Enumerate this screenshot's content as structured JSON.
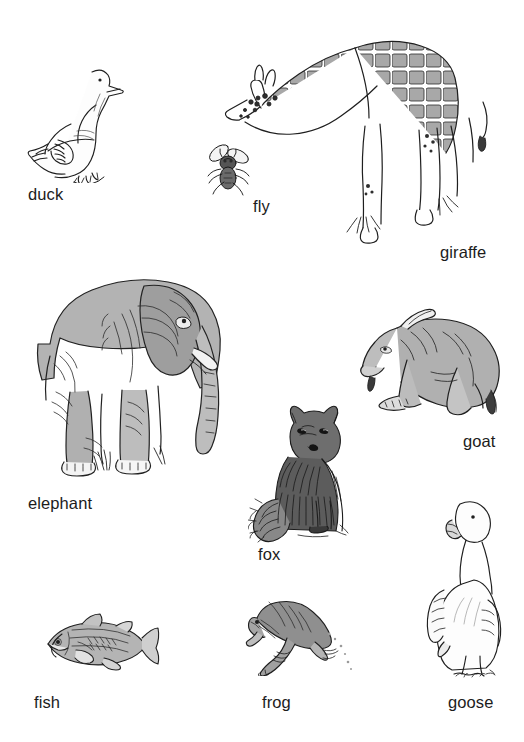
{
  "page": {
    "kind": "illustrated-vocabulary-sheet",
    "background_color": "#ffffff",
    "ink_color": "#1c1c1c",
    "wash_color": "#9d9d9d",
    "width": 524,
    "height": 742
  },
  "items": [
    {
      "id": "duck",
      "label": "duck",
      "icon_name": "duck-illustration",
      "description": "pen-and-ink drawing of a white duck standing, facing right"
    },
    {
      "id": "fly",
      "label": "fly",
      "icon_name": "fly-illustration",
      "description": "small dark ink drawing of a housefly with spread wings"
    },
    {
      "id": "giraffe",
      "label": "giraffe",
      "icon_name": "giraffe-illustration",
      "description": "ink drawing of a giraffe bending its neck down to the left, patched coat"
    },
    {
      "id": "elephant",
      "label": "elephant",
      "icon_name": "elephant-illustration",
      "description": "grey wash drawing of an elephant standing, trunk hanging down, facing right"
    },
    {
      "id": "goat",
      "label": "goat",
      "icon_name": "goat-illustration",
      "description": "ink and wash drawing of a goat lying down, facing left, horns back"
    },
    {
      "id": "fox",
      "label": "fox",
      "icon_name": "fox-illustration",
      "description": "dark hatched drawing of a fox sitting upright with bushy tail"
    },
    {
      "id": "fish",
      "label": "fish",
      "icon_name": "fish-illustration",
      "description": "grey wash drawing of a fish facing left"
    },
    {
      "id": "frog",
      "label": "frog",
      "icon_name": "frog-illustration",
      "description": "grey wash drawing of a frog leaping to the left"
    },
    {
      "id": "goose",
      "label": "goose",
      "icon_name": "goose-illustration",
      "description": "pen drawing of a white goose standing upright facing the viewer"
    }
  ]
}
